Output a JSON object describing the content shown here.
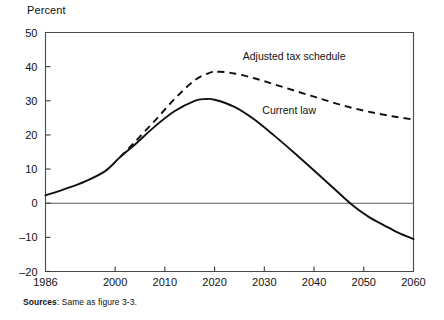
{
  "figure": {
    "y_axis_title": "Percent",
    "sources_label": "Sources",
    "sources_text": ": Same as figure 3-3."
  },
  "chart_data": {
    "type": "line",
    "title": "",
    "subtitle": "",
    "xlabel": "",
    "ylabel": "Percent",
    "xlim": [
      1986,
      2060
    ],
    "ylim": [
      -20,
      50
    ],
    "grid": false,
    "legend": "inline annotations",
    "x_ticks": [
      1986,
      2000,
      2010,
      2020,
      2030,
      2040,
      2050,
      2060
    ],
    "x_tick_labels": [
      "1986",
      "2000",
      "2010",
      "2020",
      "2030",
      "2040",
      "2050",
      "2060"
    ],
    "y_ticks": [
      -20,
      -10,
      0,
      10,
      20,
      30,
      40,
      50
    ],
    "y_tick_labels": [
      "–20",
      "–10",
      "0",
      "10",
      "20",
      "30",
      "40",
      "50"
    ],
    "zero_reference_line": 0,
    "annotations": [
      {
        "text": "Adjusted tax schedule",
        "x": 2036,
        "y": 42
      },
      {
        "text": "Current law",
        "x": 2035,
        "y": 26
      }
    ],
    "series": [
      {
        "name": "Current law",
        "style": "solid",
        "x": [
          1986,
          1990,
          1994,
          1998,
          2001,
          2004,
          2008,
          2012,
          2016,
          2018,
          2020,
          2024,
          2028,
          2032,
          2036,
          2040,
          2044,
          2048,
          2051,
          2054,
          2057,
          2060
        ],
        "values": [
          2.3,
          4.2,
          6.4,
          9.4,
          13.5,
          17.2,
          22.5,
          27.0,
          30.0,
          30.5,
          30.3,
          28.2,
          24.5,
          19.8,
          14.8,
          9.6,
          4.3,
          -0.9,
          -4.0,
          -6.4,
          -8.7,
          -10.5
        ]
      },
      {
        "name": "Adjusted tax schedule",
        "style": "dashed",
        "x": [
          2001,
          2004,
          2008,
          2012,
          2016,
          2019,
          2021,
          2024,
          2028,
          2032,
          2036,
          2040,
          2044,
          2048,
          2052,
          2056,
          2060
        ],
        "values": [
          13.5,
          18.0,
          24.2,
          30.6,
          36.0,
          38.2,
          38.5,
          38.0,
          36.6,
          34.8,
          33.0,
          31.2,
          29.4,
          27.8,
          26.5,
          25.4,
          24.5
        ]
      }
    ]
  }
}
